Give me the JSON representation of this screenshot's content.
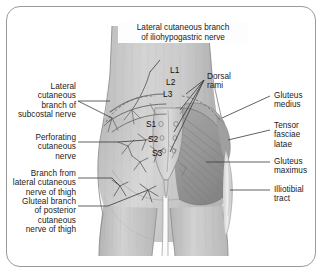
{
  "figure": {
    "kind": "anatomical-illustration",
    "region": "posterior gluteal region",
    "view": "posterior view of lower back, buttocks and upper thighs",
    "border_color": "#9a9a9a",
    "background_color": "#ffffff",
    "skin_tone": "#c9c9c9",
    "muscle_tone": "#9c9c9c",
    "nerve_color": "#6d6d6d"
  },
  "title_label": {
    "text": "Lateral cutaneous branch\nof iliohypogastric nerve",
    "position": "top-center"
  },
  "left_labels": [
    {
      "id": "lateral-cutaneous-branch-of-subcostal-nerve",
      "text": "Lateral\ncutaneous\nbranch of\nsubcostal nerve"
    },
    {
      "id": "perforating-cutaneous-nerve",
      "text": "Perforating\ncutaneous\nnerve"
    },
    {
      "id": "branch-from-lateral-cutaneous-nerve-of-thigh",
      "text": "Branch from\nlateral cutaneous\nnerve of thigh"
    },
    {
      "id": "gluteal-branch-of-posterior-cutaneous-nerve-of-thigh",
      "text": "Gluteal branch\nof posterior\ncutaneous\nnerve of thigh"
    }
  ],
  "right_labels": [
    {
      "id": "gluteus-medius",
      "text": "Gluteus\nmedius"
    },
    {
      "id": "tensor-fasciae-latae",
      "text": "Tensor\nfasciae\nlatae"
    },
    {
      "id": "gluteus-maximus",
      "text": "Gluteus\nmaximus"
    },
    {
      "id": "illiotibial-tract",
      "text": "Illiotibial\ntract"
    }
  ],
  "center_labels": {
    "dorsal_rami": "Dorsal\nrami",
    "lumbar_levels": [
      "L1",
      "L2",
      "L3"
    ],
    "sacral_levels": [
      "S1",
      "S2",
      "S3"
    ]
  }
}
